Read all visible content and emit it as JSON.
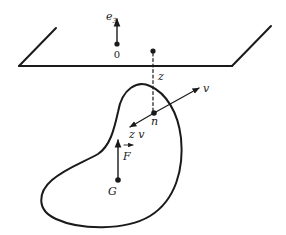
{
  "diagram": {
    "type": "physics-free-body-floating",
    "labels": {
      "axis_vector": "e",
      "axis_vector_sub": "3",
      "origin": "0",
      "depth": "z",
      "normal": "v",
      "point_n": "n",
      "pressure": "z v",
      "force": "F",
      "centroid": "G"
    },
    "colors": {
      "ink": "#1a1a1a",
      "background": "#ffffff"
    }
  }
}
